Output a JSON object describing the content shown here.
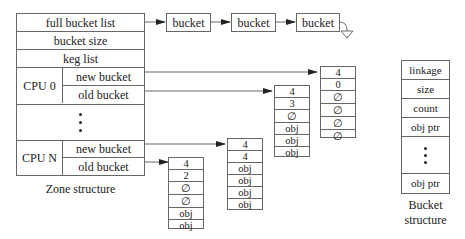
{
  "zone": {
    "full_bucket_list": "full bucket list",
    "bucket_size": "bucket size",
    "keg_list": "keg list",
    "cpu0_label": "CPU 0",
    "cpuN_label": "CPU N",
    "new_bucket": "new bucket",
    "old_bucket": "old bucket",
    "caption": "Zone structure"
  },
  "full_list": [
    "bucket",
    "bucket",
    "bucket"
  ],
  "bucket_structure": {
    "fields": [
      "linkage",
      "size",
      "count",
      "obj ptr",
      "obj ptr"
    ],
    "caption_line1": "Bucket",
    "caption_line2": "structure"
  },
  "buckets": {
    "cpu0_new": [
      "4",
      "0",
      "∅",
      "∅",
      "∅",
      "∅"
    ],
    "cpu0_old": [
      "4",
      "3",
      "∅",
      "obj",
      "obj",
      "obj"
    ],
    "cpuN_new": [
      "4",
      "4",
      "obj",
      "obj",
      "obj",
      "obj"
    ],
    "cpuN_old": [
      "4",
      "2",
      "∅",
      "∅",
      "obj",
      "obj"
    ]
  }
}
